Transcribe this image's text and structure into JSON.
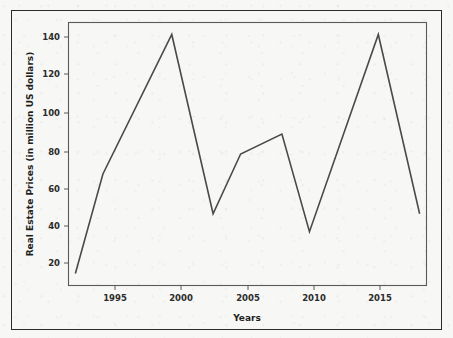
{
  "figure": {
    "name": "real-estate-prices-line-chart",
    "background_color": "#f7f7f5",
    "border_color": "#2a2a2a",
    "line_color": "#4a4a4a"
  },
  "chart_data": {
    "type": "line",
    "title": "",
    "xlabel": "Years",
    "ylabel": "Real Estate Prices (in million US dollars)",
    "xlim": [
      1992.5,
      2018.5
    ],
    "ylim": [
      14,
      146
    ],
    "xticks": [
      1995,
      2000,
      2005,
      2010,
      2015
    ],
    "xtick_labels": [
      "1995",
      "2000",
      "2005",
      "2010",
      "2015"
    ],
    "yticks": [
      20,
      40,
      60,
      80,
      100,
      120,
      140
    ],
    "ytick_labels": [
      "20",
      "40",
      "60",
      "80",
      "100",
      "120",
      "140"
    ],
    "grid": false,
    "legend": false,
    "series": [
      {
        "name": "Real Estate Prices",
        "x": [
          1993,
          1995,
          2000,
          2003,
          2005,
          2008,
          2010,
          2015,
          2018
        ],
        "values": [
          20,
          70,
          140,
          50,
          80,
          90,
          41,
          140,
          50
        ]
      }
    ]
  }
}
